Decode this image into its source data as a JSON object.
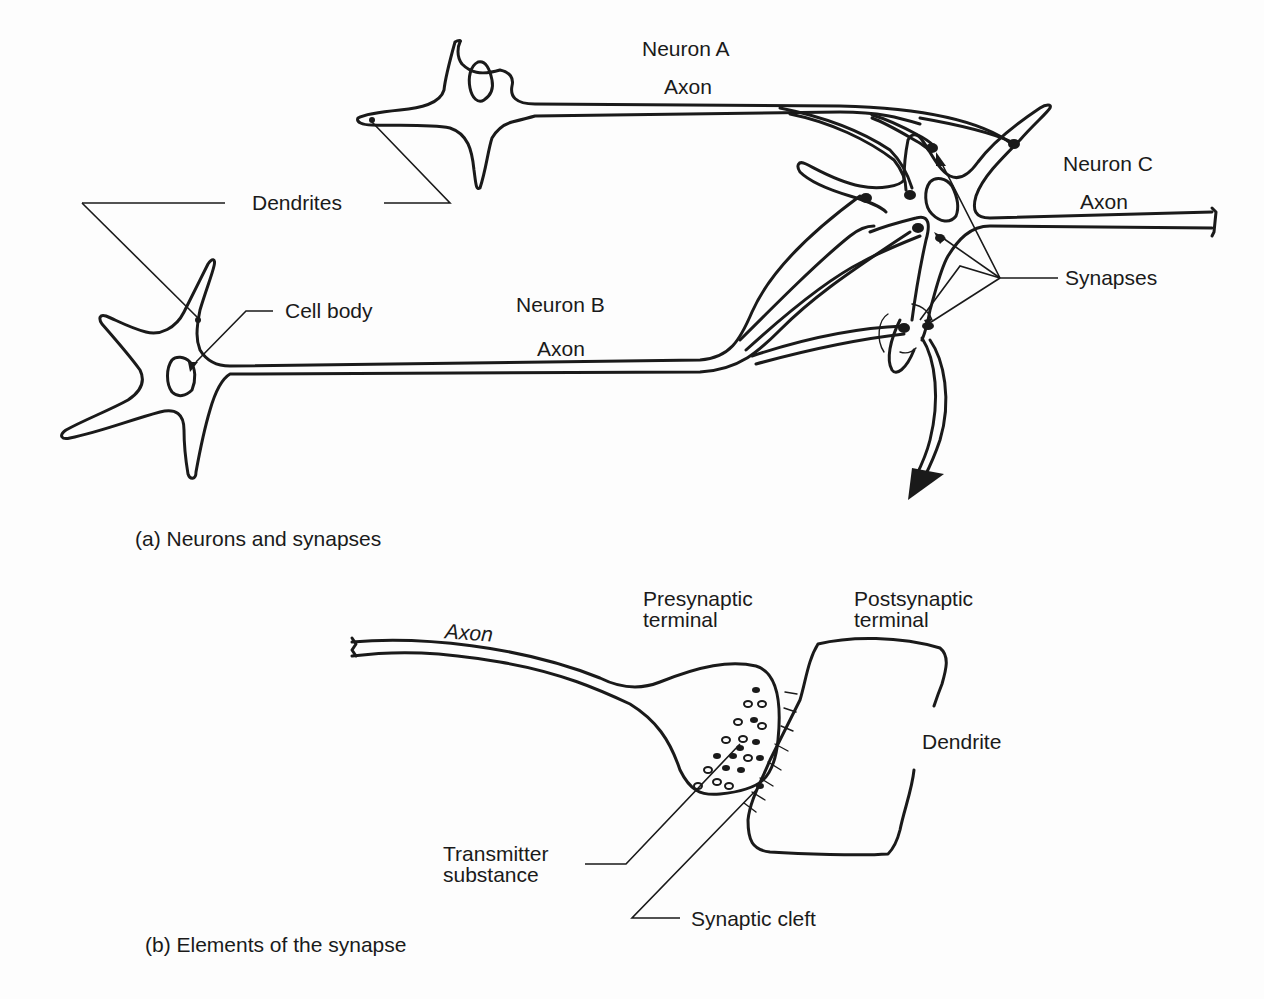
{
  "panel_a": {
    "caption": "(a) Neurons and synapses",
    "labels": {
      "neuron_a": "Neuron A",
      "neuron_a_axon": "Axon",
      "neuron_b": "Neuron B",
      "neuron_b_axon": "Axon",
      "neuron_c": "Neuron C",
      "neuron_c_axon": "Axon",
      "dendrites": "Dendrites",
      "cell_body": "Cell body",
      "synapses": "Synapses"
    }
  },
  "panel_b": {
    "caption": "(b) Elements of the synapse",
    "labels": {
      "axon": "Axon",
      "presynaptic_terminal": "Presynaptic\nterminal",
      "postsynaptic_terminal": "Postsynaptic\nterminal",
      "dendrite": "Dendrite",
      "transmitter_substance": "Transmitter\nsubstance",
      "synaptic_cleft": "Synaptic cleft"
    }
  },
  "colors": {
    "ink": "#1a1a1a",
    "background": "#fdfdfd"
  }
}
